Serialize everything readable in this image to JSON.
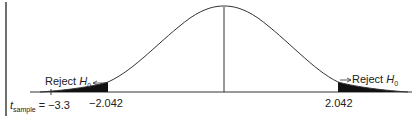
{
  "diagram": {
    "type": "t-distribution two-tailed rejection regions",
    "left_reject_label": "Reject",
    "right_reject_label": "Reject",
    "hypothesis_symbol": "H",
    "hypothesis_subscript": "0",
    "t_sample_symbol": "t",
    "t_sample_subscript": "sample",
    "t_sample_value": "= −3.3",
    "left_critical_value": "−2.042",
    "right_critical_value": "2.042"
  }
}
